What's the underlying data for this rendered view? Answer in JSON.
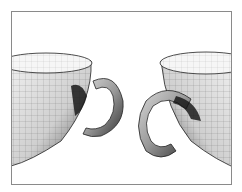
{
  "figure": {
    "colors": {
      "frame": "#8a8a8a",
      "background": "#ffffff",
      "mesh_line": "#333333",
      "shade_dark": "#1a1a1a",
      "shade_light": "#e8e8e8"
    },
    "objects": [
      {
        "name": "left-cup",
        "type": "cup-bowl"
      },
      {
        "name": "left-handle",
        "type": "c-shaped-handle"
      },
      {
        "name": "right-cup",
        "type": "cup-bowl"
      },
      {
        "name": "right-handle",
        "type": "c-shaped-handle"
      }
    ]
  }
}
